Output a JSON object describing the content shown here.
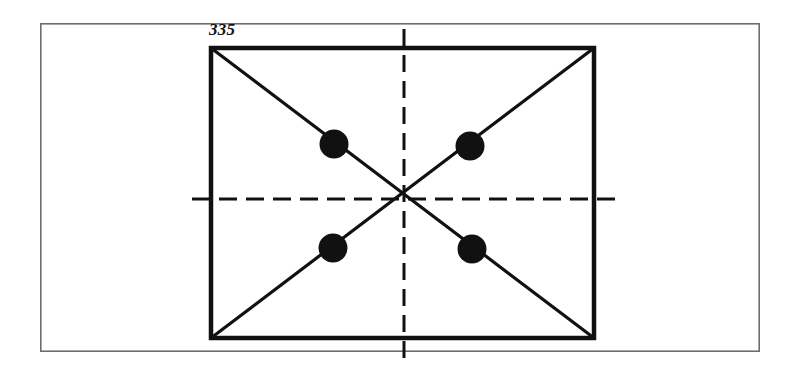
{
  "figure": {
    "label": "335",
    "caption_position": "top-left-outside",
    "background_color": "#ffffff",
    "ink_color": "#111111",
    "outer_frame_color": "#6d6d6d",
    "outer_frame": {
      "name": "page-border",
      "x": 40,
      "y": 23,
      "width": 720,
      "height": 329,
      "stroke_width": 1.6
    },
    "rectangle": {
      "name": "main-rectangle",
      "x": 211,
      "y": 48,
      "width": 383,
      "height": 290,
      "stroke_width": 4.5
    },
    "diagonals": [
      {
        "name": "diagonal-top-left-to-bottom-right",
        "x1": 211,
        "y1": 48,
        "x2": 594,
        "y2": 338
      },
      {
        "name": "diagonal-top-right-to-bottom-left",
        "x1": 594,
        "y1": 48,
        "x2": 211,
        "y2": 338
      }
    ],
    "centre_lines": [
      {
        "name": "horizontal-centre-line",
        "orientation": "horizontal",
        "x1": 192,
        "y1": 199,
        "x2": 617,
        "y2": 199,
        "dash": "18 9",
        "stroke_width": 3
      },
      {
        "name": "vertical-centre-line",
        "orientation": "vertical",
        "x1": 404,
        "y1": 29,
        "x2": 404,
        "y2": 361,
        "dash": "17 9",
        "stroke_width": 3
      }
    ],
    "centre_point": {
      "x": 404,
      "y": 199
    },
    "dots": [
      {
        "name": "dot-upper-left",
        "cx": 334,
        "cy": 144,
        "r": 14.5
      },
      {
        "name": "dot-upper-right",
        "cx": 470,
        "cy": 146,
        "r": 14.5
      },
      {
        "name": "dot-lower-left",
        "cx": 333,
        "cy": 248,
        "r": 14.5
      },
      {
        "name": "dot-lower-right",
        "cx": 472,
        "cy": 249,
        "r": 14.5
      }
    ]
  }
}
